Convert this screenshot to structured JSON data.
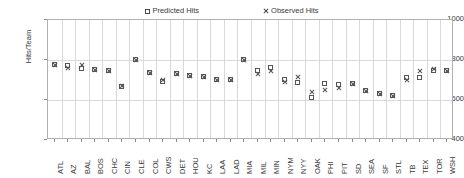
{
  "chart_data": {
    "type": "scatter",
    "title": "",
    "xlabel": "",
    "ylabel": "Hits/Team",
    "ylim": [
      400,
      1000
    ],
    "y_ticks": [
      400,
      600,
      800,
      1000
    ],
    "grid": true,
    "legend_position": "top",
    "categories": [
      "ATL",
      "AZ",
      "BAL",
      "BOS",
      "CHC",
      "CIN",
      "CLE",
      "COL",
      "CWS",
      "DET",
      "HOU",
      "KC",
      "LAA",
      "LAD",
      "MIA",
      "MIL",
      "MIN",
      "NYM",
      "NYY",
      "OAK",
      "PHI",
      "PIT",
      "SD",
      "SEA",
      "SF",
      "STL",
      "TB",
      "TEX",
      "TOR",
      "WSH"
    ],
    "series": [
      {
        "name": "Predicted Hits",
        "marker": "square",
        "color": "#565656",
        "values": [
          775,
          770,
          755,
          750,
          745,
          665,
          800,
          735,
          690,
          730,
          720,
          715,
          700,
          700,
          800,
          745,
          760,
          700,
          685,
          610,
          680,
          675,
          680,
          645,
          630,
          620,
          710,
          710,
          745,
          745
        ]
      },
      {
        "name": "Observed Hits",
        "marker": "cross",
        "color": "#565656",
        "values": [
          775,
          760,
          775,
          750,
          745,
          670,
          800,
          735,
          700,
          730,
          720,
          715,
          700,
          700,
          800,
          730,
          745,
          690,
          715,
          640,
          650,
          660,
          680,
          645,
          630,
          620,
          700,
          745,
          755,
          745
        ]
      }
    ]
  },
  "legend": {
    "entries": [
      {
        "label": "Predicted Hits",
        "marker": "square"
      },
      {
        "label": "Observed Hits",
        "marker": "cross"
      }
    ]
  }
}
